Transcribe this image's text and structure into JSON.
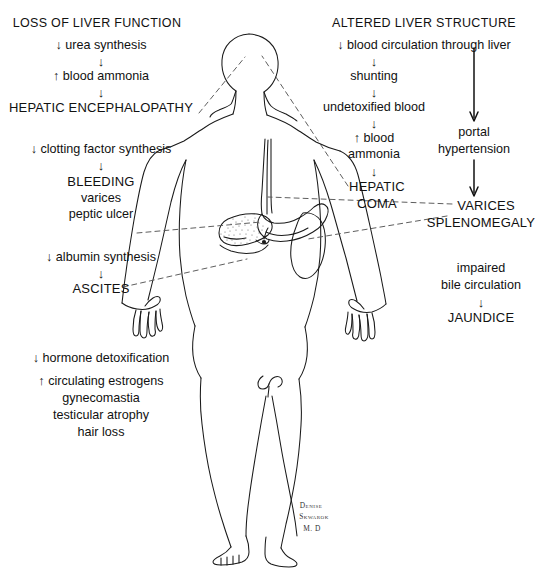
{
  "figure": {
    "title_left": "LOSS OF LIVER FUNCTION",
    "title_right": "ALTERED LIVER STRUCTURE",
    "signature": {
      "line1": "Denise",
      "line2": "Skwarok",
      "line3": "M. D"
    }
  },
  "left_column": {
    "chain_a": {
      "s1": "↓ urea synthesis",
      "s2": "↑ blood ammonia",
      "s3": "HEPATIC ENCEPHALOPATHY"
    },
    "chain_b": {
      "s1": "↓ clotting factor synthesis",
      "s2": "BLEEDING",
      "s3": "varices",
      "s4": "peptic ulcer"
    },
    "chain_c": {
      "s1": "↓ albumin synthesis",
      "s2": "ASCITES"
    },
    "chain_d": {
      "s1": "↓ hormone detoxification",
      "s2": "↑ circulating estrogens",
      "s3": "gynecomastia",
      "s4": "testicular atrophy",
      "s5": "hair loss"
    }
  },
  "right_column": {
    "chain_a": {
      "s1": "↓ blood circulation through liver",
      "s2": "shunting",
      "s3": "undetoxified blood",
      "s4a": "↑ blood",
      "s4b": "ammonia",
      "s5a": "HEPATIC",
      "s5b": "COMA"
    },
    "chain_b": {
      "s1a": "portal",
      "s1b": "hypertension",
      "s2a": "VARICES",
      "s2b": "SPLENOMEGALY"
    },
    "chain_c": {
      "s1a": "impaired",
      "s1b": "bile circulation",
      "s2": "JAUNDICE"
    }
  },
  "anatomy": {
    "organs": [
      "liver",
      "stomach",
      "spleen",
      "esophagus",
      "gallbladder"
    ],
    "leader_targets": {
      "hepatic_encephalopathy": "head",
      "hepatic_coma": "head",
      "peptic_ulcer": "stomach",
      "varices": "esophagus",
      "splenomegaly": "spleen",
      "ascites": "abdomen"
    }
  },
  "colors": {
    "ink": "#111111",
    "line": "#1a1a1a",
    "dashed": "#555555",
    "paper": "#ffffff",
    "stipple": "#777777"
  }
}
